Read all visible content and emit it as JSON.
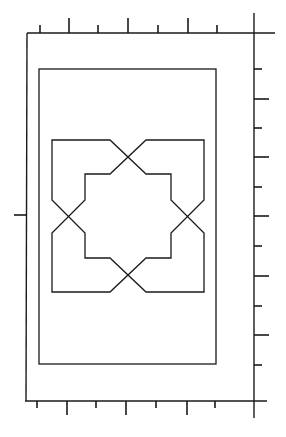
{
  "diagram": {
    "colors": {
      "stroke": "#1a1a1a",
      "background": "#ffffff"
    },
    "outer_frame": {
      "left": 27,
      "top": 33,
      "right": 254,
      "bottom": 401
    },
    "inner_frame": {
      "left": 39,
      "top": 69,
      "right": 216,
      "bottom": 364
    },
    "axes": {
      "top_line": {
        "x1": 27,
        "y1": 33,
        "x2": 275,
        "y2": 33
      },
      "right_line": {
        "x1": 254,
        "y1": 13,
        "x2": 254,
        "y2": 418
      },
      "bottom_line": {
        "x1": 25,
        "y1": 401,
        "x2": 267,
        "y2": 401
      },
      "left_tick": {
        "x1": 14,
        "y1": 215,
        "x2": 27,
        "y2": 215
      }
    },
    "top_ticks": [
      {
        "x": 40,
        "len": "short"
      },
      {
        "x": 69,
        "len": "long"
      },
      {
        "x": 98,
        "len": "short"
      },
      {
        "x": 128,
        "len": "long"
      },
      {
        "x": 158,
        "len": "short"
      },
      {
        "x": 188,
        "len": "long"
      },
      {
        "x": 217,
        "len": "short"
      }
    ],
    "bottom_ticks": [
      {
        "x": 37,
        "len": "short"
      },
      {
        "x": 67,
        "len": "long"
      },
      {
        "x": 96,
        "len": "short"
      },
      {
        "x": 126,
        "len": "long"
      },
      {
        "x": 156,
        "len": "short"
      },
      {
        "x": 187,
        "len": "long"
      },
      {
        "x": 215,
        "len": "short"
      }
    ],
    "right_ticks": [
      {
        "y": 69,
        "len": "short"
      },
      {
        "y": 99,
        "len": "long"
      },
      {
        "y": 128,
        "len": "short"
      },
      {
        "y": 157,
        "len": "long"
      },
      {
        "y": 187,
        "len": "short"
      },
      {
        "y": 216,
        "len": "long"
      },
      {
        "y": 246,
        "len": "short"
      },
      {
        "y": 276,
        "len": "long"
      },
      {
        "y": 306,
        "len": "short"
      },
      {
        "y": 335,
        "len": "long"
      },
      {
        "y": 365,
        "len": "short"
      }
    ],
    "star": {
      "center": {
        "x": 128,
        "y": 216
      },
      "crossings": [
        {
          "name": "top",
          "x": 128,
          "y": 157
        },
        {
          "name": "right",
          "x": 187,
          "y": 216
        },
        {
          "name": "bottom",
          "x": 128,
          "y": 275
        },
        {
          "name": "left",
          "x": 68,
          "y": 216
        }
      ],
      "outer_box": {
        "left": 52,
        "top": 140,
        "right": 204,
        "bottom": 292
      },
      "inner_box": {
        "left": 85,
        "top": 174,
        "right": 171,
        "bottom": 258
      }
    }
  }
}
